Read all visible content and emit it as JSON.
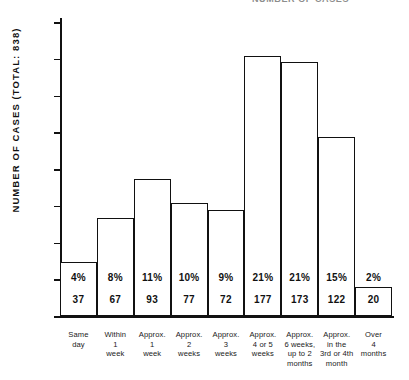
{
  "header": {
    "clipped_text": "NUMBER OF CASES"
  },
  "axes": {
    "y_title": "NUMBER OF CASES   (TOTAL: 838)",
    "y_ticks": [
      "200",
      "175",
      "150",
      "125",
      "100",
      "75",
      "50",
      "25",
      "0"
    ]
  },
  "chart_data": {
    "type": "bar",
    "title": "",
    "subtitle": "",
    "xlabel": "",
    "ylabel": "NUMBER OF CASES   (TOTAL: 838)",
    "ylim": [
      0,
      200
    ],
    "yticks": [
      0,
      25,
      50,
      75,
      100,
      125,
      150,
      175,
      200
    ],
    "grid": false,
    "legend": "none",
    "total": 838,
    "categories": [
      "Same day",
      "Within 1 week",
      "Approx. 1 week",
      "Approx. 2 weeks",
      "Approx. 3 weeks",
      "Approx. 4 or 5 weeks",
      "Approx. 6 weeks, up to 2 months",
      "Approx. in the 3rd or 4th month",
      "Over 4 months"
    ],
    "category_lines": [
      [
        "Same",
        "day"
      ],
      [
        "Within",
        "1",
        "week"
      ],
      [
        "Approx.",
        "1",
        "week"
      ],
      [
        "Approx.",
        "2",
        "weeks"
      ],
      [
        "Approx.",
        "3",
        "weeks"
      ],
      [
        "Approx.",
        "4 or 5",
        "weeks"
      ],
      [
        "Approx.",
        "6 weeks,",
        "up to 2",
        "months"
      ],
      [
        "Approx.",
        "in the",
        "3rd or 4th",
        "month"
      ],
      [
        "Over",
        "4",
        "months"
      ]
    ],
    "values": [
      37,
      67,
      93,
      77,
      72,
      177,
      173,
      122,
      20
    ],
    "percent_labels": [
      "4%",
      "8%",
      "11%",
      "10%",
      "9%",
      "21%",
      "21%",
      "15%",
      "2%"
    ],
    "value_labels": [
      "37",
      "67",
      "93",
      "77",
      "72",
      "177",
      "173",
      "122",
      "20"
    ],
    "bar_fill": "#ffffff",
    "bar_edge": "#111111"
  }
}
